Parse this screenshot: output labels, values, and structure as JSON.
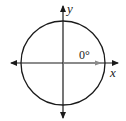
{
  "diagram": {
    "type": "unit-circle-angle",
    "labels": {
      "y_axis": "y",
      "x_axis": "x",
      "angle": "0°"
    },
    "colors": {
      "axis": "#1a1a1a",
      "circle": "#1a1a1a",
      "ray": "#8a8a8a",
      "background": "#ffffff"
    },
    "geometry": {
      "center": [
        63,
        63
      ],
      "radius": 42,
      "ray_angle_degrees": 0
    }
  }
}
